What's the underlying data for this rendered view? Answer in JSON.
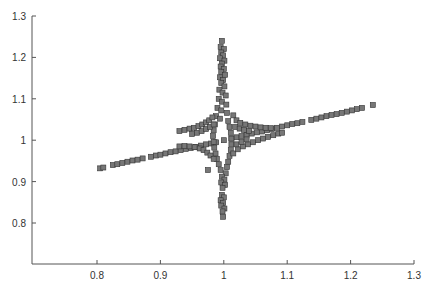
{
  "chart_data": {
    "type": "scatter",
    "title": "",
    "xlabel": "",
    "ylabel": "",
    "xlim": [
      0.7,
      1.3
    ],
    "ylim": [
      0.7,
      1.3
    ],
    "xticks": [
      0.8,
      0.9,
      1,
      1.1,
      1.2,
      1.3
    ],
    "xtick_labels": [
      "0.8",
      "0.9",
      "1",
      "1.1",
      "1.2",
      "1.3"
    ],
    "yticks": [
      0.8,
      0.9,
      1,
      1.1,
      1.2,
      1.3
    ],
    "ytick_labels": [
      "0.8",
      "0.9",
      "1",
      "1.1",
      "1.2",
      "1.3"
    ],
    "grid": false,
    "legend": null,
    "marker": "square",
    "marker_color": "#777777",
    "marker_edge_color": "#333333",
    "series": [
      {
        "name": "diagonal-line",
        "points": [
          [
            0.805,
            0.932
          ],
          [
            0.81,
            0.934
          ],
          [
            0.825,
            0.94
          ],
          [
            0.832,
            0.942
          ],
          [
            0.84,
            0.945
          ],
          [
            0.848,
            0.948
          ],
          [
            0.856,
            0.951
          ],
          [
            0.864,
            0.953
          ],
          [
            0.872,
            0.956
          ],
          [
            0.885,
            0.96
          ],
          [
            0.893,
            0.963
          ],
          [
            0.9,
            0.965
          ],
          [
            0.908,
            0.968
          ],
          [
            0.916,
            0.971
          ],
          [
            0.924,
            0.973
          ],
          [
            0.932,
            0.976
          ],
          [
            0.94,
            0.979
          ],
          [
            0.948,
            0.981
          ],
          [
            0.956,
            0.984
          ],
          [
            0.964,
            0.987
          ],
          [
            0.972,
            0.99
          ],
          [
            0.98,
            0.992
          ],
          [
            0.988,
            0.995
          ],
          [
            1.0,
            1.0
          ],
          [
            1.012,
            1.004
          ],
          [
            1.02,
            1.007
          ],
          [
            1.028,
            1.01
          ],
          [
            1.036,
            1.013
          ],
          [
            1.044,
            1.016
          ],
          [
            1.052,
            1.019
          ],
          [
            1.06,
            1.021
          ],
          [
            1.068,
            1.024
          ],
          [
            1.076,
            1.027
          ],
          [
            1.084,
            1.03
          ],
          [
            1.092,
            1.033
          ],
          [
            1.1,
            1.036
          ],
          [
            1.108,
            1.039
          ],
          [
            1.116,
            1.041
          ],
          [
            1.124,
            1.044
          ],
          [
            1.138,
            1.049
          ],
          [
            1.146,
            1.052
          ],
          [
            1.154,
            1.055
          ],
          [
            1.162,
            1.058
          ],
          [
            1.17,
            1.061
          ],
          [
            1.178,
            1.063
          ],
          [
            1.186,
            1.066
          ],
          [
            1.194,
            1.069
          ],
          [
            1.202,
            1.072
          ],
          [
            1.21,
            1.075
          ],
          [
            1.218,
            1.078
          ],
          [
            1.235,
            1.085
          ]
        ]
      },
      {
        "name": "vertical-spike",
        "points": [
          [
            0.997,
            1.24
          ],
          [
            0.995,
            1.225
          ],
          [
            1.0,
            1.22
          ],
          [
            0.996,
            1.212
          ],
          [
            0.999,
            1.205
          ],
          [
            0.994,
            1.198
          ],
          [
            1.001,
            1.192
          ],
          [
            0.997,
            1.185
          ],
          [
            0.995,
            1.178
          ],
          [
            1.0,
            1.172
          ],
          [
            0.996,
            1.165
          ],
          [
            1.002,
            1.158
          ],
          [
            0.994,
            1.152
          ],
          [
            0.999,
            1.145
          ],
          [
            0.996,
            1.138
          ],
          [
            1.001,
            1.13
          ],
          [
            0.993,
            1.122
          ],
          [
            0.998,
            1.115
          ],
          [
            1.003,
            1.108
          ],
          [
            0.992,
            1.1
          ],
          [
            0.997,
            1.093
          ],
          [
            1.004,
            1.086
          ],
          [
            0.99,
            1.078
          ],
          [
            0.996,
            1.072
          ],
          [
            1.005,
            1.066
          ],
          [
            0.988,
            1.058
          ],
          [
            0.994,
            1.052
          ],
          [
            1.007,
            1.046
          ],
          [
            0.986,
            1.038
          ],
          [
            1.009,
            1.032
          ],
          [
            0.984,
            1.024
          ],
          [
            1.011,
            1.018
          ],
          [
            0.983,
            1.01
          ],
          [
            1.012,
            1.004
          ],
          [
            0.984,
            0.996
          ],
          [
            1.012,
            0.99
          ],
          [
            0.985,
            0.982
          ],
          [
            1.011,
            0.976
          ],
          [
            0.987,
            0.968
          ],
          [
            1.009,
            0.962
          ],
          [
            0.989,
            0.955
          ],
          [
            1.007,
            0.948
          ],
          [
            0.992,
            0.942
          ],
          [
            1.005,
            0.935
          ],
          [
            0.995,
            0.928
          ],
          [
            1.003,
            0.92
          ],
          [
            0.997,
            0.912
          ],
          [
            1.001,
            0.905
          ],
          [
            0.996,
            0.898
          ],
          [
            1.002,
            0.892
          ],
          [
            0.998,
            0.885
          ],
          [
            0.997,
            0.868
          ],
          [
            1.0,
            0.862
          ],
          [
            0.995,
            0.855
          ],
          [
            0.999,
            0.848
          ],
          [
            0.996,
            0.842
          ],
          [
            1.001,
            0.835
          ],
          [
            0.998,
            0.828
          ],
          [
            0.999,
            0.815
          ],
          [
            0.975,
            0.928
          ]
        ]
      },
      {
        "name": "upper-left-arm",
        "points": [
          [
            0.93,
            1.022
          ],
          [
            0.938,
            1.025
          ],
          [
            0.946,
            1.028
          ],
          [
            0.953,
            1.03
          ],
          [
            0.96,
            1.034
          ],
          [
            0.966,
            1.038
          ],
          [
            0.972,
            1.043
          ],
          [
            0.977,
            1.048
          ],
          [
            0.982,
            1.055
          ],
          [
            0.95,
            1.015
          ],
          [
            0.958,
            1.018
          ],
          [
            0.965,
            1.022
          ],
          [
            0.972,
            1.027
          ],
          [
            0.978,
            1.032
          ],
          [
            0.984,
            1.038
          ]
        ]
      },
      {
        "name": "lower-left-arm",
        "points": [
          [
            0.93,
            0.985
          ],
          [
            0.938,
            0.986
          ],
          [
            0.946,
            0.985
          ],
          [
            0.954,
            0.983
          ],
          [
            0.962,
            0.98
          ],
          [
            0.968,
            0.976
          ],
          [
            0.974,
            0.97
          ],
          [
            0.979,
            0.963
          ],
          [
            0.984,
            0.955
          ]
        ]
      },
      {
        "name": "upper-right-arm",
        "points": [
          [
            1.015,
            1.06
          ],
          [
            1.02,
            1.048
          ],
          [
            1.026,
            1.042
          ],
          [
            1.034,
            1.038
          ],
          [
            1.042,
            1.035
          ],
          [
            1.05,
            1.033
          ],
          [
            1.058,
            1.031
          ],
          [
            1.066,
            1.03
          ],
          [
            1.074,
            1.029
          ],
          [
            1.018,
            1.032
          ],
          [
            1.025,
            1.028
          ],
          [
            1.032,
            1.025
          ],
          [
            1.04,
            1.022
          ]
        ]
      },
      {
        "name": "lower-right-arm",
        "points": [
          [
            1.015,
            0.968
          ],
          [
            1.022,
            0.978
          ],
          [
            1.03,
            0.985
          ],
          [
            1.038,
            0.99
          ],
          [
            1.046,
            0.995
          ],
          [
            1.054,
            1.0
          ],
          [
            1.062,
            1.004
          ],
          [
            1.07,
            1.008
          ],
          [
            1.078,
            1.012
          ],
          [
            1.086,
            1.016
          ],
          [
            1.092,
            1.018
          ],
          [
            1.02,
            0.99
          ],
          [
            1.028,
            0.996
          ],
          [
            1.036,
            1.002
          ]
        ]
      }
    ]
  }
}
